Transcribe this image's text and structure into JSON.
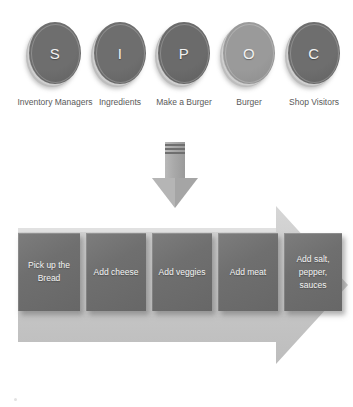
{
  "diagram": {
    "type": "SIPOC process diagram"
  },
  "sipoc": {
    "nodes": [
      {
        "letter": "S",
        "label": "Inventory\nManagers",
        "color": "#6e6e6e",
        "x": 22
      },
      {
        "letter": "I",
        "label": "Ingredients",
        "color": "#6e6e6e",
        "x": 87
      },
      {
        "letter": "P",
        "label": "Make a Burger",
        "color": "#6b6b6b",
        "x": 151
      },
      {
        "letter": "O",
        "label": "Burger",
        "color": "#9a9a9a",
        "x": 216
      },
      {
        "letter": "C",
        "label": "Shop Visitors",
        "color": "#6e6e6e",
        "x": 281
      }
    ]
  },
  "flow_arrow": {
    "name": "down-arrow",
    "direction": "down",
    "color": "#a5a5a5"
  },
  "process": {
    "banner_color": "#c9c9c9",
    "banner_direction": "right",
    "steps": [
      {
        "text": "Pick up the\nBread",
        "x": 0,
        "width": 62
      },
      {
        "text": "Add cheese",
        "x": 68,
        "width": 60
      },
      {
        "text": "Add veggies",
        "x": 134,
        "width": 60
      },
      {
        "text": "Add meat",
        "x": 200,
        "width": 60
      },
      {
        "text": "Add salt,\npepper,\nsauces",
        "x": 266,
        "width": 58
      }
    ]
  },
  "colors": {
    "background": "#ffffff",
    "coin_dark": "#6e6e6e",
    "coin_light": "#9a9a9a",
    "box_gray": "#6f6f6f",
    "banner_gray": "#c9c9c9",
    "label_text": "#595959",
    "box_text": "#f4f4f4"
  }
}
